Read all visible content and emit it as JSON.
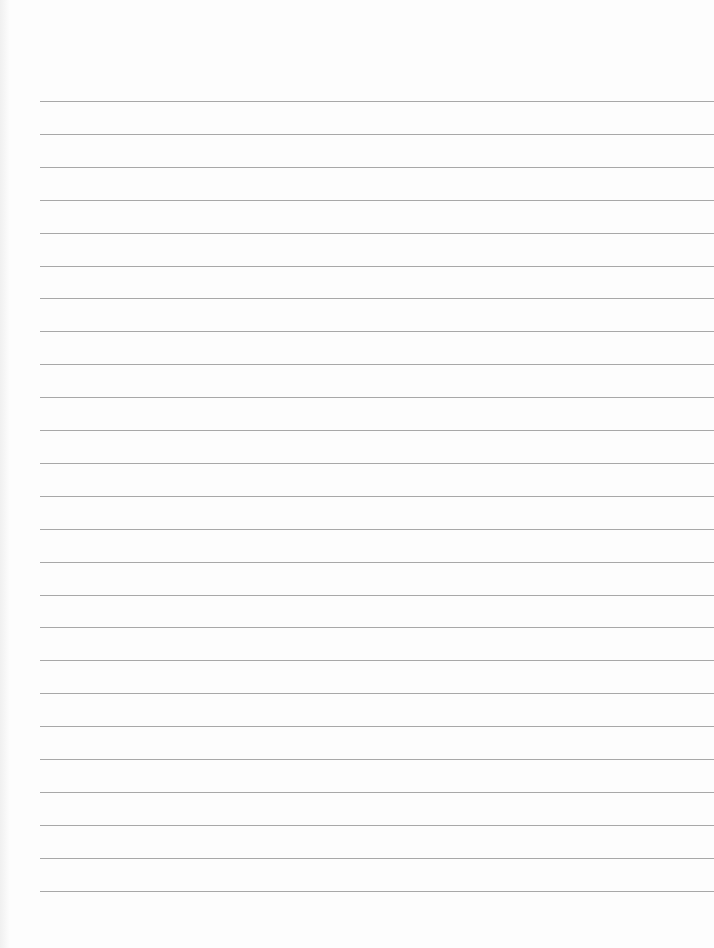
{
  "document": {
    "type": "lined paper",
    "line_count": 25,
    "first_line_y": 101,
    "line_spacing": 32.9,
    "line_left": 40,
    "line_color": "#a8a8a8",
    "background_color": "#fdfdfd"
  }
}
